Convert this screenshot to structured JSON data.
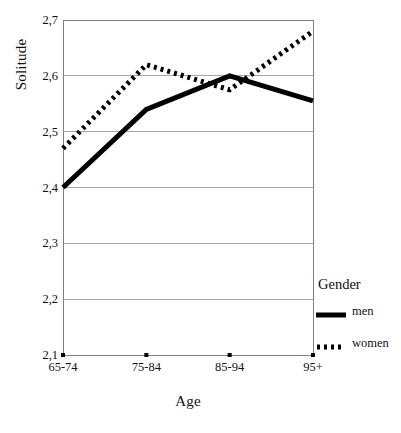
{
  "chart_data": {
    "type": "line",
    "title": "",
    "xlabel": "Age",
    "ylabel": "Solitude",
    "categories": [
      "65-74",
      "75-84",
      "85-94",
      "95+"
    ],
    "series": [
      {
        "name": "men",
        "style": "solid",
        "color": "#000000",
        "values": [
          2.4,
          2.54,
          2.6,
          2.555
        ]
      },
      {
        "name": "women",
        "style": "dotted",
        "color": "#000000",
        "values": [
          2.47,
          2.62,
          2.575,
          2.68
        ]
      }
    ],
    "ylim": [
      2.1,
      2.7
    ],
    "ytick_labels": [
      "2,7",
      "2,6",
      "2,5",
      "2,4",
      "2,3",
      "2,2",
      "2,1"
    ],
    "ytick_values": [
      2.7,
      2.6,
      2.5,
      2.4,
      2.3,
      2.2,
      2.1
    ],
    "grid": true,
    "grid_color": "#a6a6a6",
    "axis_color": "#7f7f7f",
    "legend_position": "right",
    "legend_title": "Gender",
    "decimal_separator": ","
  },
  "legend": {
    "title": "Gender",
    "entries": [
      {
        "label": "men",
        "style": "solid"
      },
      {
        "label": "women",
        "style": "dotted"
      }
    ]
  },
  "axes": {
    "y_title": "Solitude",
    "x_title": "Age"
  }
}
